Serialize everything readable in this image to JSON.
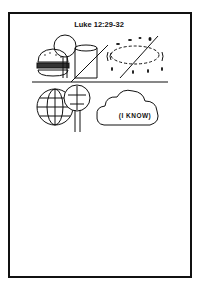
{
  "worksheet": {
    "title": "Luke 12:29-32",
    "cloud_label": "(I KNOW)",
    "top_row_icons": [
      "hamburger-icon",
      "glass-icon",
      "rain-drops-icon"
    ],
    "bottom_row_icons": [
      "globe-icon",
      "tree-icon",
      "thought-cloud-icon"
    ],
    "strike_color": "#111111"
  }
}
